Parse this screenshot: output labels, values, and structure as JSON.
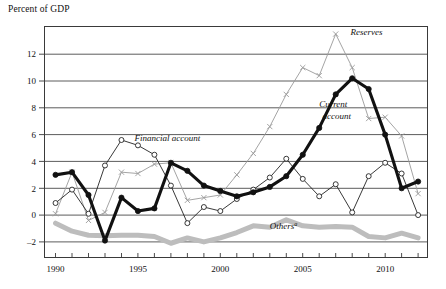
{
  "figure": {
    "y_axis_title": "Percent of GDP",
    "footnote_marker": "a"
  },
  "annotations": [
    {
      "id": "financial-account",
      "text": "Financial account",
      "x": 1994.8,
      "y": 5.55
    },
    {
      "id": "reserves",
      "text": "Reserves",
      "x": 2007.9,
      "y": 13.4
    },
    {
      "id": "current-account",
      "text": "Current",
      "x": 2006.0,
      "y": 8.1
    },
    {
      "id": "current-account-2",
      "text": "account",
      "x": 2006.2,
      "y": 7.2
    },
    {
      "id": "others",
      "text": "Others",
      "x": 2003.0,
      "y": -1.05
    }
  ],
  "chart_data": {
    "type": "line",
    "title": "",
    "xlabel": "",
    "ylabel": "Percent of GDP",
    "xlim": [
      1989.3,
      2012.6
    ],
    "ylim": [
      -3.2,
      14.1
    ],
    "yticks": [
      -2,
      0,
      2,
      4,
      6,
      8,
      10,
      12
    ],
    "ytick_labels": [
      "–2",
      "0",
      "2",
      "4",
      "6",
      "8",
      "10",
      "12"
    ],
    "xticks": [
      1990,
      1991,
      1992,
      1993,
      1994,
      1995,
      1996,
      1997,
      1998,
      1999,
      2000,
      2001,
      2002,
      2003,
      2004,
      2005,
      2006,
      2007,
      2008,
      2009,
      2010,
      2011,
      2012
    ],
    "xtick_labels_shown": [
      "1990",
      "1995",
      "2000",
      "2005",
      "2010"
    ],
    "xtick_labels_positions": [
      1990,
      1995,
      2000,
      2005,
      2010
    ],
    "grid": "horizontal",
    "legend_position": "inline-annotations",
    "x": [
      1990,
      1991,
      1992,
      1993,
      1994,
      1995,
      1996,
      1997,
      1998,
      1999,
      2000,
      2001,
      2002,
      2003,
      2004,
      2005,
      2006,
      2007,
      2008,
      2009,
      2010,
      2011,
      2012
    ],
    "series": [
      {
        "name": "Current account",
        "style": "thick-black-line-filled-markers",
        "color": "#111111",
        "marker": "filled-circle",
        "values": [
          3.0,
          3.2,
          1.5,
          -1.9,
          1.3,
          0.3,
          0.5,
          3.9,
          3.3,
          2.2,
          1.8,
          1.4,
          1.7,
          2.1,
          2.9,
          4.5,
          6.5,
          9.0,
          10.2,
          9.4,
          6.0,
          2.0,
          2.5
        ]
      },
      {
        "name": "Financial account",
        "style": "thin-dark-line-open-markers",
        "color": "#222222",
        "marker": "open-circle",
        "values": [
          0.9,
          1.9,
          0.1,
          3.7,
          5.6,
          5.2,
          4.5,
          2.2,
          -0.6,
          0.6,
          0.3,
          1.2,
          1.9,
          2.8,
          4.2,
          2.7,
          1.4,
          2.3,
          0.2,
          2.9,
          3.9,
          3.1,
          0.0
        ]
      },
      {
        "name": "Reserves",
        "style": "thin-gray-line-cross-markers",
        "color": "#9a9a9a",
        "marker": "x-cross",
        "values": [
          0.1,
          3.2,
          -0.4,
          0.2,
          3.2,
          3.1,
          3.8,
          3.9,
          1.1,
          1.3,
          1.5,
          3.0,
          4.6,
          6.6,
          9.0,
          11.0,
          10.4,
          13.5,
          11.0,
          7.2,
          7.3,
          5.9,
          1.6
        ]
      },
      {
        "name": "Others",
        "style": "thick-gray-band",
        "color": "#bdbdbd",
        "marker": "none",
        "values": [
          -0.6,
          -1.2,
          -1.5,
          -1.55,
          -1.5,
          -1.5,
          -1.6,
          -2.1,
          -1.7,
          -2.0,
          -1.7,
          -1.3,
          -0.8,
          -0.9,
          -0.35,
          -0.8,
          -0.9,
          -0.85,
          -0.9,
          -1.6,
          -1.7,
          -1.35,
          -1.7
        ]
      }
    ]
  }
}
